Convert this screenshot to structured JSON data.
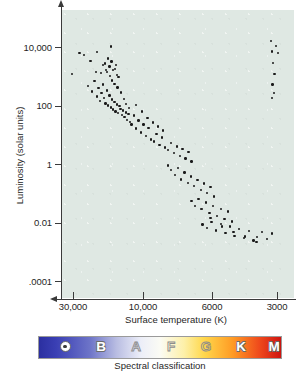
{
  "chart_data": {
    "type": "scatter",
    "title": "",
    "xlabel": "Surface temperature (K)",
    "ylabel": "Luminosity (solar units)",
    "x_scale": "log-reversed",
    "y_scale": "log",
    "grid": false,
    "legend": "none",
    "xlim": [
      30000,
      2600
    ],
    "ylim": [
      0.0001,
      100000
    ],
    "xticks": [
      "30,000",
      "10,000",
      "6000",
      "3000"
    ],
    "xtick_values": [
      30000,
      10000,
      6000,
      3000
    ],
    "yticks": [
      "10,000",
      "100",
      "1",
      "0.01",
      ".0001"
    ],
    "ytick_values": [
      10000,
      100,
      1,
      0.01,
      0.0001
    ],
    "series": [
      {
        "name": "main-sequence-and-giants",
        "marker": "dot",
        "color": "#1a1a1a",
        "points": [
          [
            0.043,
            0.222
          ],
          [
            0.075,
            0.15
          ],
          [
            0.096,
            0.157
          ],
          [
            0.123,
            0.176
          ],
          [
            0.146,
            0.215
          ],
          [
            0.152,
            0.145
          ],
          [
            0.167,
            0.219
          ],
          [
            0.176,
            0.191
          ],
          [
            0.184,
            0.186
          ],
          [
            0.19,
            0.208
          ],
          [
            0.195,
            0.216
          ],
          [
            0.198,
            0.168
          ],
          [
            0.205,
            0.196
          ],
          [
            0.207,
            0.23
          ],
          [
            0.213,
            0.179
          ],
          [
            0.216,
            0.245
          ],
          [
            0.221,
            0.208
          ],
          [
            0.226,
            0.256
          ],
          [
            0.232,
            0.19
          ],
          [
            0.236,
            0.225
          ],
          [
            0.24,
            0.269
          ],
          [
            0.112,
            0.263
          ],
          [
            0.128,
            0.283
          ],
          [
            0.14,
            0.247
          ],
          [
            0.15,
            0.3
          ],
          [
            0.158,
            0.271
          ],
          [
            0.163,
            0.316
          ],
          [
            0.17,
            0.288
          ],
          [
            0.176,
            0.258
          ],
          [
            0.182,
            0.305
          ],
          [
            0.188,
            0.324
          ],
          [
            0.193,
            0.28
          ],
          [
            0.199,
            0.331
          ],
          [
            0.204,
            0.297
          ],
          [
            0.21,
            0.339
          ],
          [
            0.215,
            0.311
          ],
          [
            0.22,
            0.345
          ],
          [
            0.226,
            0.32
          ],
          [
            0.231,
            0.352
          ],
          [
            0.236,
            0.328
          ],
          [
            0.241,
            0.358
          ],
          [
            0.247,
            0.334
          ],
          [
            0.252,
            0.343
          ],
          [
            0.258,
            0.365
          ],
          [
            0.263,
            0.349
          ],
          [
            0.269,
            0.372
          ],
          [
            0.275,
            0.356
          ],
          [
            0.281,
            0.381
          ],
          [
            0.287,
            0.362
          ],
          [
            0.293,
            0.388
          ],
          [
            0.212,
            0.127
          ],
          [
            0.228,
            0.204
          ],
          [
            0.244,
            0.233
          ],
          [
            0.255,
            0.287
          ],
          [
            0.266,
            0.308
          ],
          [
            0.277,
            0.326
          ],
          [
            0.288,
            0.341
          ],
          [
            0.3,
            0.398
          ],
          [
            0.31,
            0.366
          ],
          [
            0.32,
            0.412
          ],
          [
            0.33,
            0.384
          ],
          [
            0.34,
            0.425
          ],
          [
            0.352,
            0.397
          ],
          [
            0.362,
            0.437
          ],
          [
            0.373,
            0.409
          ],
          [
            0.384,
            0.449
          ],
          [
            0.396,
            0.456
          ],
          [
            0.408,
            0.43
          ],
          [
            0.42,
            0.468
          ],
          [
            0.432,
            0.443
          ],
          [
            0.445,
            0.478
          ],
          [
            0.318,
            0.33
          ],
          [
            0.345,
            0.352
          ],
          [
            0.368,
            0.374
          ],
          [
            0.392,
            0.39
          ],
          [
            0.414,
            0.404
          ],
          [
            0.436,
            0.418
          ],
          [
            0.458,
            0.487
          ],
          [
            0.47,
            0.462
          ],
          [
            0.482,
            0.497
          ],
          [
            0.495,
            0.474
          ],
          [
            0.508,
            0.506
          ],
          [
            0.52,
            0.483
          ],
          [
            0.533,
            0.516
          ],
          [
            0.546,
            0.492
          ],
          [
            0.558,
            0.526
          ],
          [
            0.456,
            0.54
          ],
          [
            0.47,
            0.556
          ],
          [
            0.486,
            0.572
          ],
          [
            0.5,
            0.548
          ],
          [
            0.514,
            0.588
          ],
          [
            0.528,
            0.564
          ],
          [
            0.542,
            0.6
          ],
          [
            0.556,
            0.578
          ],
          [
            0.57,
            0.612
          ],
          [
            0.584,
            0.59
          ],
          [
            0.598,
            0.624
          ],
          [
            0.612,
            0.602
          ],
          [
            0.626,
            0.636
          ],
          [
            0.64,
            0.614
          ],
          [
            0.654,
            0.648
          ],
          [
            0.558,
            0.664
          ],
          [
            0.572,
            0.68
          ],
          [
            0.588,
            0.656
          ],
          [
            0.604,
            0.692
          ],
          [
            0.62,
            0.668
          ],
          [
            0.636,
            0.704
          ],
          [
            0.652,
            0.68
          ],
          [
            0.668,
            0.716
          ],
          [
            0.684,
            0.692
          ],
          [
            0.7,
            0.726
          ],
          [
            0.716,
            0.7
          ],
          [
            0.732,
            0.734
          ],
          [
            0.606,
            0.745
          ],
          [
            0.625,
            0.757
          ],
          [
            0.645,
            0.736
          ],
          [
            0.664,
            0.766
          ],
          [
            0.684,
            0.744
          ],
          [
            0.704,
            0.775
          ],
          [
            0.724,
            0.752
          ],
          [
            0.744,
            0.784
          ],
          [
            0.764,
            0.76
          ],
          [
            0.784,
            0.792
          ],
          [
            0.805,
            0.768
          ],
          [
            0.826,
            0.8
          ],
          [
            0.598,
            0.692
          ],
          [
            0.64,
            0.722
          ],
          [
            0.69,
            0.752
          ],
          [
            0.74,
            0.77
          ],
          [
            0.79,
            0.786
          ],
          [
            0.84,
            0.788
          ],
          [
            0.862,
            0.77
          ],
          [
            0.884,
            0.796
          ],
          [
            0.906,
            0.776
          ],
          [
            0.838,
            0.805
          ],
          [
            0.902,
            0.108
          ],
          [
            0.922,
            0.125
          ],
          [
            0.906,
            0.144
          ],
          [
            0.93,
            0.15
          ],
          [
            0.91,
            0.185
          ],
          [
            0.916,
            0.222
          ],
          [
            0.908,
            0.258
          ],
          [
            0.914,
            0.288
          ],
          [
            0.906,
            0.306
          ]
        ]
      }
    ]
  },
  "axes": {
    "x_title": "Surface temperature (K)",
    "y_title": "Luminosity (solar units)",
    "x_labels": [
      "30,000",
      "10,000",
      "6000",
      "3000"
    ],
    "y_labels": [
      "10,000",
      "100",
      "1",
      "0.01",
      ".0001"
    ]
  },
  "spectral": {
    "caption": "Spectral classification",
    "classes": [
      {
        "letter": "O",
        "style": "light",
        "has_sun_symbol": true,
        "color": "#2f34a6"
      },
      {
        "letter": "B",
        "style": "light",
        "has_sun_symbol": false,
        "color": "#6d74c8"
      },
      {
        "letter": "A",
        "style": "outline",
        "has_sun_symbol": false,
        "color": "#c7cbe8"
      },
      {
        "letter": "F",
        "style": "outline",
        "has_sun_symbol": false,
        "color": "#f7f7ef"
      },
      {
        "letter": "G",
        "style": "outline",
        "has_sun_symbol": false,
        "color": "#ffd84d"
      },
      {
        "letter": "K",
        "style": "light",
        "has_sun_symbol": false,
        "color": "#ff9b24"
      },
      {
        "letter": "M",
        "style": "light",
        "has_sun_symbol": false,
        "color": "#d81a12"
      }
    ],
    "gradient_stops": [
      "#2b2fa0",
      "#6d74c8",
      "#b9bde2",
      "#fbfbf4",
      "#ffd84d",
      "#ff9b24",
      "#cf1410"
    ]
  },
  "colors": {
    "plot_background": "#dfe8e3",
    "axis": "#3a3a3a",
    "point": "#1a1a1a",
    "page_background": "#ffffff"
  }
}
